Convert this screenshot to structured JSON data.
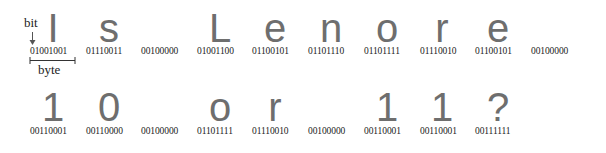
{
  "annotations": {
    "bit_label": "bit",
    "byte_label": "byte"
  },
  "rows": [
    {
      "characters": [
        {
          "glyph": "I",
          "binary": "01001001"
        },
        {
          "glyph": "s",
          "binary": "01110011"
        },
        {
          "glyph": " ",
          "binary": "00100000"
        },
        {
          "glyph": "L",
          "binary": "01001100"
        },
        {
          "glyph": "e",
          "binary": "01100101"
        },
        {
          "glyph": "n",
          "binary": "01101110"
        },
        {
          "glyph": "o",
          "binary": "01101111"
        },
        {
          "glyph": "r",
          "binary": "01110010"
        },
        {
          "glyph": "e",
          "binary": "01100101"
        },
        {
          "glyph": " ",
          "binary": "00100000"
        }
      ]
    },
    {
      "characters": [
        {
          "glyph": "1",
          "binary": "00110001"
        },
        {
          "glyph": "0",
          "binary": "00110000"
        },
        {
          "glyph": " ",
          "binary": "00100000"
        },
        {
          "glyph": "o",
          "binary": "01101111"
        },
        {
          "glyph": "r",
          "binary": "01110010"
        },
        {
          "glyph": " ",
          "binary": "00100000"
        },
        {
          "glyph": "1",
          "binary": "00110001"
        },
        {
          "glyph": "1",
          "binary": "00110001"
        },
        {
          "glyph": "?",
          "binary": "00111111"
        }
      ]
    }
  ],
  "colors": {
    "glyph": "#6e6e6e",
    "binary_text": "#222222",
    "background": "#ffffff"
  }
}
